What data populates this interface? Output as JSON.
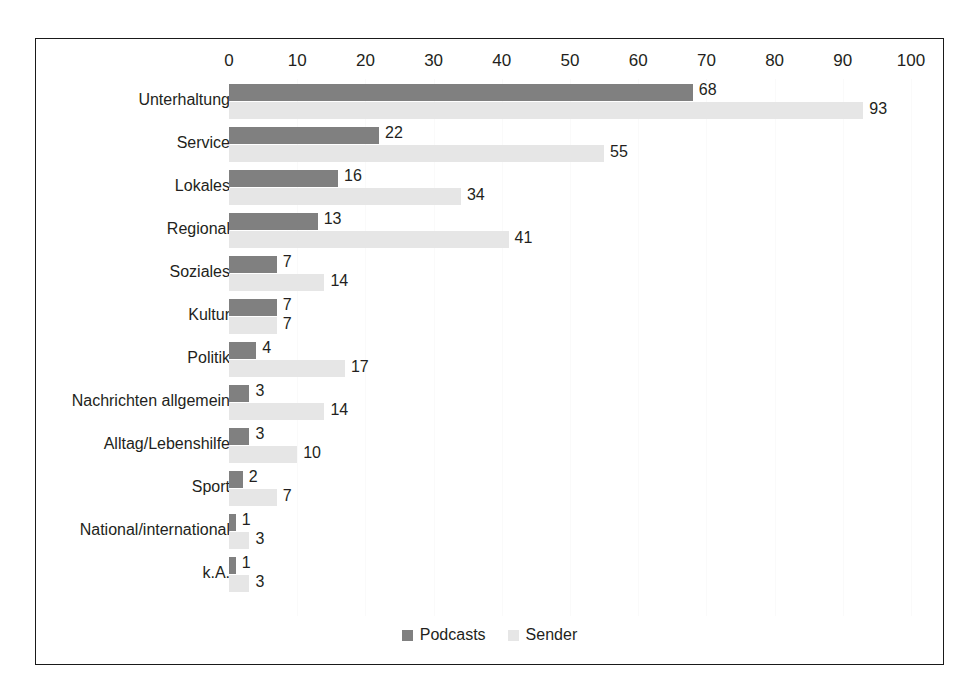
{
  "chart_data": {
    "type": "bar",
    "orientation": "horizontal",
    "title": "",
    "xlabel": "",
    "ylabel": "",
    "xlim": [
      0,
      100
    ],
    "xticks": [
      0,
      10,
      20,
      30,
      40,
      50,
      60,
      70,
      80,
      90,
      100
    ],
    "grid": true,
    "legend_position": "bottom",
    "categories": [
      "Unterhaltung",
      "Service",
      "Lokales",
      "Regional",
      "Soziales",
      "Kultur",
      "Politik",
      "Nachrichten allgemein",
      "Alltag/Lebenshilfe",
      "Sport",
      "National/international",
      "k.A."
    ],
    "series": [
      {
        "name": "Podcasts",
        "color": "#808080",
        "values": [
          68,
          22,
          16,
          13,
          7,
          7,
          4,
          3,
          3,
          2,
          1,
          1
        ]
      },
      {
        "name": "Sender",
        "color": "#e6e6e6",
        "values": [
          93,
          55,
          34,
          41,
          14,
          7,
          17,
          14,
          10,
          7,
          3,
          3
        ]
      }
    ]
  },
  "legend": {
    "items": [
      {
        "label": "Podcasts",
        "swatch": "dark"
      },
      {
        "label": "Sender",
        "swatch": "light"
      }
    ]
  }
}
